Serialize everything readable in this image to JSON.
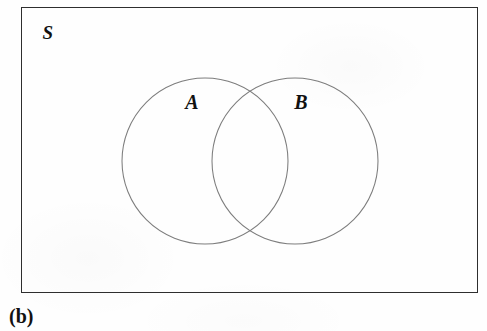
{
  "figure": {
    "type": "venn-diagram",
    "caption": "(b)",
    "canvas": {
      "width": 487,
      "height": 331,
      "background": "#fefefe"
    }
  },
  "universal_set": {
    "label": "S",
    "shape": "rectangle",
    "border_color": "#2e2e2e",
    "x": 21,
    "y": 7,
    "width": 457,
    "height": 286
  },
  "sets": [
    {
      "label": "A",
      "shape": "circle",
      "cx": 205,
      "cy": 161,
      "r": 83,
      "stroke_color": "#7d7d7d",
      "label_x": 192,
      "label_y": 102
    },
    {
      "label": "B",
      "shape": "circle",
      "cx": 295,
      "cy": 161,
      "r": 83,
      "stroke_color": "#7d7d7d",
      "label_x": 301,
      "label_y": 102
    }
  ],
  "intersection": {
    "upper_point": {
      "x": 247,
      "y": 100
    },
    "lower_point": {
      "x": 247,
      "y": 222
    },
    "shaded": false
  }
}
